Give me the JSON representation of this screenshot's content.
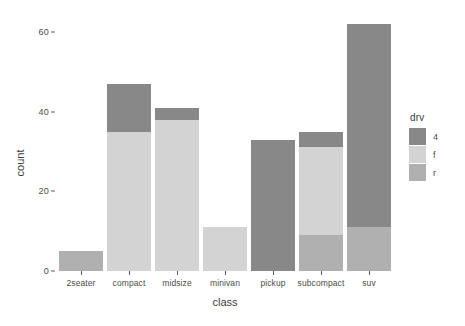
{
  "chart_data": {
    "type": "bar",
    "stacked": true,
    "title": "",
    "xlabel": "class",
    "ylabel": "count",
    "categories": [
      "2seater",
      "compact",
      "midsize",
      "minivan",
      "pickup",
      "subcompact",
      "suv"
    ],
    "series": [
      {
        "name": "4",
        "color": "#888888",
        "values": [
          0,
          12,
          3,
          0,
          33,
          4,
          51
        ]
      },
      {
        "name": "f",
        "color": "#d3d3d3",
        "values": [
          0,
          35,
          38,
          11,
          0,
          22,
          0
        ]
      },
      {
        "name": "r",
        "color": "#b0b0b0",
        "values": [
          5,
          0,
          0,
          0,
          0,
          9,
          11
        ]
      }
    ],
    "stack_order": [
      "r",
      "f",
      "4"
    ],
    "totals": [
      5,
      47,
      41,
      11,
      33,
      35,
      62
    ],
    "yticks": [
      0,
      20,
      40,
      60
    ],
    "ylim": [
      0,
      65
    ],
    "grid": false,
    "legend": {
      "title": "drv",
      "position": "right",
      "entries": [
        {
          "label": "4",
          "color": "#888888"
        },
        {
          "label": "f",
          "color": "#d3d3d3"
        },
        {
          "label": "r",
          "color": "#b0b0b0"
        }
      ]
    },
    "panel_background": "#ffffff",
    "axis_text_color": "#4d4d4d"
  }
}
